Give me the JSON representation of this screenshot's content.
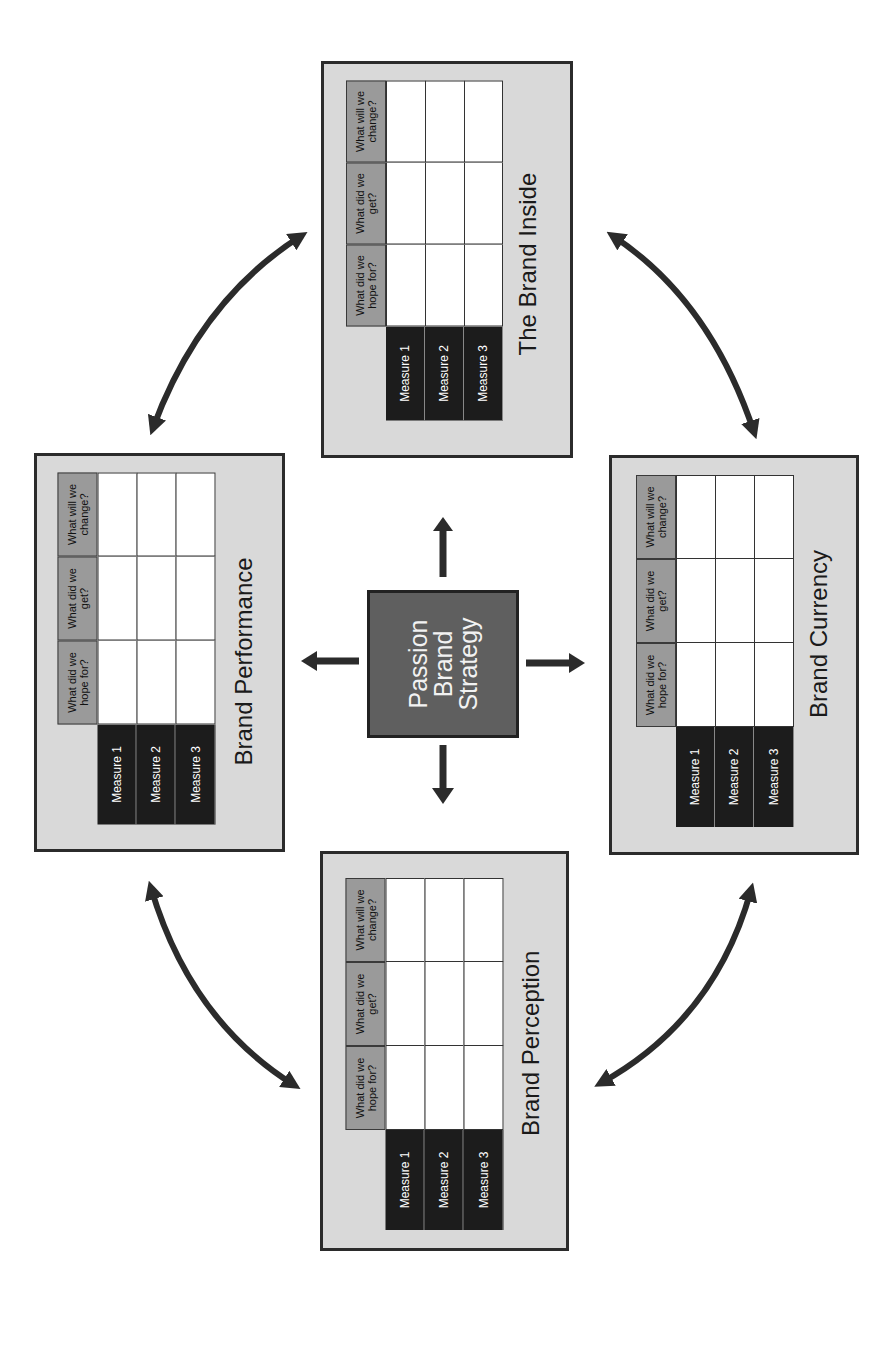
{
  "diagram": {
    "center": {
      "lines": [
        "Passion",
        "Brand",
        "Strategy"
      ],
      "fill": "#5f5f5f"
    },
    "panels": [
      {
        "id": "brand-inside",
        "title": "The Brand Inside",
        "box": [
          321,
          61,
          252,
          397
        ]
      },
      {
        "id": "brand-performance",
        "title": "Brand Performance",
        "box": [
          34,
          453,
          251,
          399
        ]
      },
      {
        "id": "brand-currency",
        "title": "Brand Currency",
        "box": [
          609,
          455,
          250,
          400
        ]
      },
      {
        "id": "brand-perception",
        "title": "Brand Perception",
        "box": [
          320,
          851,
          249,
          400
        ]
      }
    ],
    "table": {
      "columns": [
        "What did we hope for?",
        "What did we get?",
        "What will we change?"
      ],
      "column_lines": [
        [
          "What did",
          "we hope for?"
        ],
        [
          "What did",
          "we get?"
        ],
        [
          "What will",
          "we change?"
        ]
      ],
      "rows": [
        "Measure 1",
        "Measure 2",
        "Measure 3"
      ]
    },
    "colors": {
      "panel_bg": "#d9d9d9",
      "header_bg": "#9a9a9a",
      "measure_bg": "#1c1c1c",
      "arrow": "#2b2b2b"
    },
    "orientation": "rotated 90 degrees counter-clockwise"
  }
}
